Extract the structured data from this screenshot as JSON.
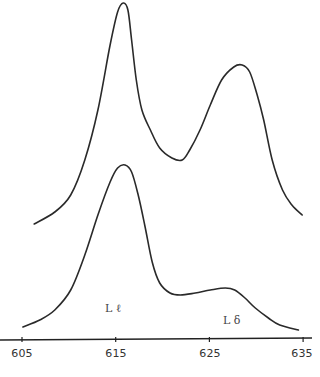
{
  "chart_data": {
    "type": "line",
    "title": "",
    "xlabel": "",
    "ylabel": "",
    "xlim": [
      603,
      636
    ],
    "grid": false,
    "legend": null,
    "x_ticks": [
      605,
      615,
      625,
      635
    ],
    "tick_labels": [
      "605",
      "615",
      "625",
      "635"
    ],
    "annotations": [
      {
        "text": "L ℓ",
        "x": 615.0,
        "near_series": "bottom"
      },
      {
        "text": "L δ",
        "x": 628.5,
        "near_series": "bottom"
      }
    ],
    "series": [
      {
        "name": "top",
        "x": [
          606.3,
          608.5,
          610.2,
          611.7,
          613.1,
          614.4,
          615.2,
          615.8,
          616.3,
          616.7,
          617.2,
          617.8,
          618.7,
          619.7,
          621.0,
          622.1,
          622.9,
          624.0,
          625.1,
          626.3,
          627.6,
          628.5,
          629.3,
          630.1,
          630.8,
          631.7,
          632.8,
          633.8,
          634.9
        ],
        "y": [
          116,
          128,
          145,
          180,
          230,
          295,
          328,
          337,
          330,
          300,
          260,
          230,
          210,
          192,
          182,
          180,
          190,
          210,
          235,
          260,
          273,
          275,
          268,
          245,
          220,
          180,
          150,
          135,
          125
        ]
      },
      {
        "name": "bottom",
        "x": [
          605.1,
          606.9,
          608.5,
          610.2,
          611.7,
          613.1,
          614.4,
          615.2,
          616.0,
          616.7,
          617.4,
          618.1,
          618.9,
          619.7,
          620.8,
          621.9,
          623.5,
          625.1,
          626.7,
          627.7,
          628.8,
          629.9,
          631.3,
          632.5,
          634.5
        ],
        "y": [
          13,
          20,
          30,
          50,
          85,
          125,
          158,
          172,
          175,
          168,
          145,
          115,
          78,
          57,
          47,
          45,
          47,
          50,
          52,
          50,
          42,
          32,
          22,
          15,
          10
        ]
      }
    ]
  },
  "axis": {
    "tick_labels": [
      "605",
      "615",
      "625",
      "635"
    ]
  },
  "labels": {
    "l_ell": "L ℓ",
    "l_delta": "L δ"
  }
}
